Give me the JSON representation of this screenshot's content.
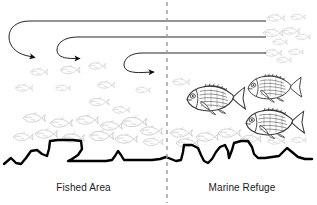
{
  "figure": {
    "type": "conceptual-diagram",
    "title": "",
    "background_color": "#ffffff",
    "width": 317,
    "height": 205
  },
  "labels": {
    "left_zone": "Fished Area",
    "right_zone": "Marine Refuge"
  },
  "divider": {
    "name": "refuge-boundary",
    "style": "dashed",
    "color": "#9a9a9a",
    "x": 167,
    "y_start": 2,
    "y_end": 203
  },
  "colors": {
    "line_dark": "#1a1a1a",
    "seafloor": "#000000",
    "faint_fish": "#c9c9c9",
    "detailed_fish": "#3a3a3a",
    "divider": "#9a9a9a",
    "text": "#1a1a1a"
  },
  "spillover_arrows": [
    {
      "name": "spillover-arrow-1",
      "line_y": 21,
      "line_x_end": 266,
      "hook_x": 14,
      "arrow_x": 42,
      "arrow_y": 57,
      "direction": "right"
    },
    {
      "name": "spillover-arrow-2",
      "line_y": 37,
      "line_x_end": 266,
      "hook_x": 62,
      "arrow_x": 87,
      "arrow_y": 58,
      "direction": "right"
    },
    {
      "name": "spillover-arrow-3",
      "line_y": 53,
      "line_x_end": 266,
      "hook_x": 129,
      "arrow_x": 161,
      "arrow_y": 72,
      "direction": "right"
    }
  ],
  "seafloor": {
    "name": "seafloor-profile",
    "stroke_width": 2.4,
    "path": "M 4,164 L 11,158 L 16,163 L 21,164 L 26,158 L 31,151 L 37,150 L 42,154 L 47,156 L 49,149 L 50,141 L 58,140 L 65,140 L 73,140 L 81,141 L 82,149 L 78,155 L 72,159 L 68,161 L 76,161 L 86,161 L 96,161 L 106,161 L 112,160 L 115,156 L 118,151 L 121,155 L 124,160 L 132,160 L 142,160 L 152,160 L 160,159 L 166,157 L 171,159 L 176,161 L 181,160 L 183,152 L 184,145 L 192,145 L 198,148 L 201,155 L 204,161 L 208,163 L 212,159 L 216,152 L 220,147 L 225,145 L 228,151 L 229,158 L 232,150 L 234,143 L 241,141 L 248,141 L 252,147 L 254,154 L 258,158 L 265,158 L 272,157 L 279,156 L 283,152 L 287,148 L 292,152 L 298,157 L 305,159 L 312,159"
  },
  "faint_fish": [
    {
      "x": 38,
      "y": 72,
      "size": 7,
      "flip": false
    },
    {
      "x": 69,
      "y": 70,
      "size": 8,
      "flip": false
    },
    {
      "x": 96,
      "y": 66,
      "size": 7,
      "flip": false
    },
    {
      "x": 23,
      "y": 88,
      "size": 7,
      "flip": false
    },
    {
      "x": 62,
      "y": 88,
      "size": 6,
      "flip": false
    },
    {
      "x": 105,
      "y": 85,
      "size": 7,
      "flip": false
    },
    {
      "x": 142,
      "y": 90,
      "size": 6,
      "flip": false
    },
    {
      "x": 180,
      "y": 82,
      "size": 7,
      "flip": false
    },
    {
      "x": 98,
      "y": 102,
      "size": 8,
      "flip": false
    },
    {
      "x": 120,
      "y": 110,
      "size": 7,
      "flip": false
    },
    {
      "x": 33,
      "y": 118,
      "size": 9,
      "flip": false
    },
    {
      "x": 60,
      "y": 123,
      "size": 9,
      "flip": false
    },
    {
      "x": 86,
      "y": 120,
      "size": 9,
      "flip": false
    },
    {
      "x": 110,
      "y": 126,
      "size": 9,
      "flip": false
    },
    {
      "x": 133,
      "y": 122,
      "size": 10,
      "flip": false
    },
    {
      "x": 150,
      "y": 131,
      "size": 9,
      "flip": false
    },
    {
      "x": 45,
      "y": 134,
      "size": 9,
      "flip": false
    },
    {
      "x": 22,
      "y": 137,
      "size": 8,
      "flip": false
    },
    {
      "x": 72,
      "y": 138,
      "size": 9,
      "flip": false
    },
    {
      "x": 100,
      "y": 136,
      "size": 10,
      "flip": false
    },
    {
      "x": 125,
      "y": 139,
      "size": 9,
      "flip": false
    },
    {
      "x": 152,
      "y": 142,
      "size": 8,
      "flip": false
    },
    {
      "x": 180,
      "y": 133,
      "size": 9,
      "flip": false
    },
    {
      "x": 186,
      "y": 143,
      "size": 9,
      "flip": false
    },
    {
      "x": 206,
      "y": 137,
      "size": 9,
      "flip": false
    },
    {
      "x": 228,
      "y": 133,
      "size": 9,
      "flip": false
    },
    {
      "x": 250,
      "y": 139,
      "size": 8,
      "flip": false
    },
    {
      "x": 275,
      "y": 141,
      "size": 7,
      "flip": false
    },
    {
      "x": 298,
      "y": 140,
      "size": 6,
      "flip": false
    },
    {
      "x": 275,
      "y": 18,
      "size": 7,
      "flip": false
    },
    {
      "x": 297,
      "y": 17,
      "size": 6,
      "flip": false
    },
    {
      "x": 272,
      "y": 33,
      "size": 8,
      "flip": false
    },
    {
      "x": 290,
      "y": 31,
      "size": 7,
      "flip": false
    },
    {
      "x": 302,
      "y": 37,
      "size": 6,
      "flip": false
    },
    {
      "x": 279,
      "y": 42,
      "size": 6,
      "flip": false
    },
    {
      "x": 272,
      "y": 53,
      "size": 7,
      "flip": false
    },
    {
      "x": 295,
      "y": 52,
      "size": 6,
      "flip": false
    },
    {
      "x": 283,
      "y": 60,
      "size": 6,
      "flip": false
    }
  ],
  "detailed_fish": [
    {
      "name": "refuge-fish-1",
      "x": 213,
      "y": 98,
      "scale": 1.0,
      "flip": false
    },
    {
      "name": "refuge-fish-2",
      "x": 272,
      "y": 87,
      "scale": 0.92,
      "flip": false
    },
    {
      "name": "refuge-fish-3",
      "x": 272,
      "y": 122,
      "scale": 1.0,
      "flip": false
    }
  ]
}
